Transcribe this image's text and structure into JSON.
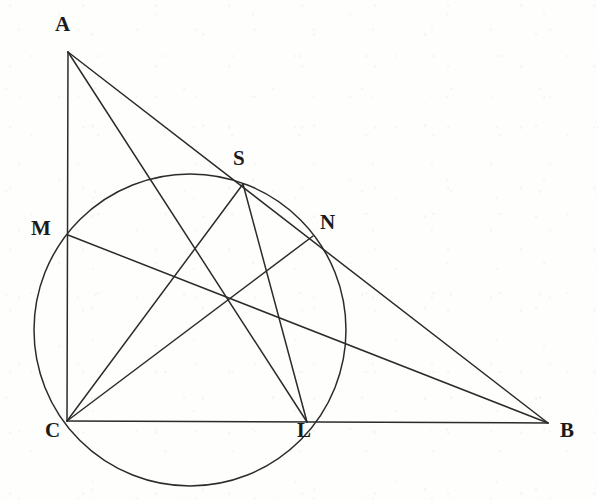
{
  "figure": {
    "kind": "euclidean-geometry-diagram",
    "canvas": {
      "width": 598,
      "height": 500
    },
    "ink_color": "#2b2b2b",
    "label_color": "#1a1a1a",
    "background_color": "#fefefd"
  },
  "points": [
    {
      "id": "A",
      "label": "A",
      "x": 68,
      "y": 52,
      "label_x": 55,
      "label_y": 18
    },
    {
      "id": "B",
      "label": "B",
      "x": 548,
      "y": 423,
      "label_x": 560,
      "label_y": 424
    },
    {
      "id": "C",
      "label": "C",
      "x": 67,
      "y": 421,
      "label_x": 45,
      "label_y": 424
    },
    {
      "id": "M",
      "label": "M",
      "x": 68,
      "y": 235,
      "label_x": 31,
      "label_y": 222
    },
    {
      "id": "S",
      "label": "S",
      "x": 243,
      "y": 184,
      "label_x": 233,
      "label_y": 152
    },
    {
      "id": "N",
      "label": "N",
      "x": 313,
      "y": 236,
      "label_x": 320,
      "label_y": 216
    },
    {
      "id": "L",
      "label": "L",
      "x": 307,
      "y": 422,
      "label_x": 297,
      "label_y": 424
    }
  ],
  "circle": {
    "id": "circumcircle",
    "cx": 190,
    "cy": 330,
    "r": 156,
    "passes_through": [
      "C",
      "M",
      "S",
      "N",
      "L"
    ]
  },
  "segments": [
    {
      "id": "AC",
      "from": "A",
      "to": "C",
      "note": "vertical side, altitude through M"
    },
    {
      "id": "AB",
      "from": "A",
      "to": "B",
      "note": "hypotenuse, crosses circle at S and N"
    },
    {
      "id": "CB",
      "from": "C",
      "to": "B",
      "note": "horizontal base, crosses circle at L"
    },
    {
      "id": "AL",
      "from": "A",
      "to": "L",
      "note": "cevian from A to L"
    },
    {
      "id": "CS",
      "from": "C",
      "to": "S",
      "note": "chord from C to S"
    },
    {
      "id": "CN",
      "from": "C",
      "to": "N",
      "note": "chord from C to N"
    },
    {
      "id": "MB",
      "from": "M",
      "to": "B",
      "note": "line from M to B"
    },
    {
      "id": "SL",
      "from": "S",
      "to": "L",
      "note": "chord from S to L"
    },
    {
      "id": "MN",
      "from": "M",
      "to": "N",
      "note": "implicit chord segment M to N along MB"
    }
  ],
  "intersection": {
    "id": "orthocenter-like-point",
    "x": 228,
    "y": 298,
    "note": "common crossing of cevians inside the circle"
  }
}
